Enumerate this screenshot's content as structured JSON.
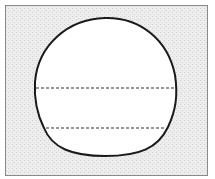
{
  "diagram": {
    "canvas": {
      "width": 215,
      "height": 179,
      "background": "#ffffff"
    },
    "frame": {
      "x": 5,
      "y": 5,
      "width": 203,
      "height": 171,
      "fill": "#e9e9e9",
      "stroke": "#8a8a8a"
    },
    "shape": {
      "type": "rounded-blob",
      "fill": "#ffffff",
      "stroke": "#1a1a1a",
      "stroke_width": 2,
      "bounds": {
        "left": 35,
        "top": 18,
        "right": 176,
        "bottom": 156
      }
    },
    "dashed_lines": [
      {
        "x1": 35,
        "y1": 88,
        "x2": 176,
        "y2": 88
      },
      {
        "x1": 46,
        "y1": 128,
        "x2": 165,
        "y2": 128
      }
    ],
    "dash_color": "#333333"
  }
}
